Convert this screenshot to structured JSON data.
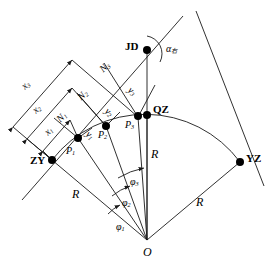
{
  "figure": {
    "type": "circular-curve-setting-out-diagram",
    "method": "tangent-offset",
    "stroke_color": "#1a1a1a",
    "point_color": "#000000",
    "background": "#ffffff"
  },
  "control_points": [
    {
      "id": "ZY",
      "label": "ZY",
      "x": 52,
      "y": 160,
      "desc": "start-of-curve"
    },
    {
      "id": "JD",
      "label": "JD",
      "x": 147,
      "y": 50,
      "desc": "intersection-point"
    },
    {
      "id": "QZ",
      "label": "QZ",
      "x": 148,
      "y": 115,
      "desc": "curve-midpoint"
    },
    {
      "id": "YZ",
      "label": "YZ",
      "x": 240,
      "y": 162,
      "desc": "end-of-curve"
    },
    {
      "id": "O",
      "label": "O",
      "x": 147,
      "y": 240,
      "desc": "curve-center"
    }
  ],
  "curve_points": [
    {
      "id": "P1",
      "label": "P",
      "sub": "1",
      "x": 78,
      "y": 138
    },
    {
      "id": "P2",
      "label": "P",
      "sub": "2",
      "x": 106,
      "y": 126
    },
    {
      "id": "P3",
      "label": "P",
      "sub": "3",
      "x": 138,
      "y": 117
    }
  ],
  "abscissa_labels": [
    {
      "id": "x1",
      "label": "x",
      "sub": "1"
    },
    {
      "id": "x2",
      "label": "x",
      "sub": "2"
    },
    {
      "id": "x3",
      "label": "x",
      "sub": "3"
    }
  ],
  "ordinate_labels": [
    {
      "id": "y1",
      "label": "y",
      "sub": "1"
    },
    {
      "id": "y2",
      "label": "y",
      "sub": "2"
    },
    {
      "id": "y3",
      "label": "y",
      "sub": "3"
    }
  ],
  "normal_labels": [
    {
      "id": "N1",
      "label": "N",
      "sub": "1"
    },
    {
      "id": "N2",
      "label": "N",
      "sub": "2"
    },
    {
      "id": "N3",
      "label": "N",
      "sub": "3"
    }
  ],
  "angle_labels": [
    {
      "id": "phi1",
      "label": "φ",
      "sub": "1"
    },
    {
      "id": "phi2",
      "label": "φ",
      "sub": "2"
    },
    {
      "id": "phi3",
      "label": "φ",
      "sub": "3"
    },
    {
      "id": "alpha",
      "label": "α",
      "sub": "右",
      "desc": "deflection-angle"
    }
  ],
  "radius_labels": [
    {
      "id": "R_left",
      "label": "R"
    },
    {
      "id": "R_center",
      "label": "R"
    },
    {
      "id": "R_right",
      "label": "R"
    }
  ]
}
